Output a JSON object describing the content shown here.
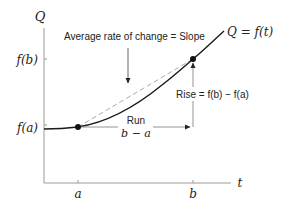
{
  "diagram": {
    "type": "function-graph",
    "axes": {
      "y_label": "Q",
      "x_label": "t",
      "x_ticks": [
        {
          "label": "a",
          "x": 78
        },
        {
          "label": "b",
          "x": 193
        }
      ],
      "y_ticks": [
        {
          "label": "f(b)",
          "y": 59
        },
        {
          "label": "f(a)",
          "y": 127
        }
      ]
    },
    "curve_label": "Q = f(t)",
    "annotations": {
      "slope": "Average rate of change = Slope",
      "rise": "Rise = f(b) − f(a)",
      "run_title": "Run",
      "run_value": "b − a"
    },
    "points": [
      {
        "name": "point-a",
        "x": 78,
        "y": 127
      },
      {
        "name": "point-b",
        "x": 193,
        "y": 59
      }
    ],
    "colors": {
      "axis": "#9a9a9a",
      "curve": "#1a1a1a",
      "secant": "#a0a0a0",
      "arrow": "#555555",
      "text": "#222222"
    }
  }
}
